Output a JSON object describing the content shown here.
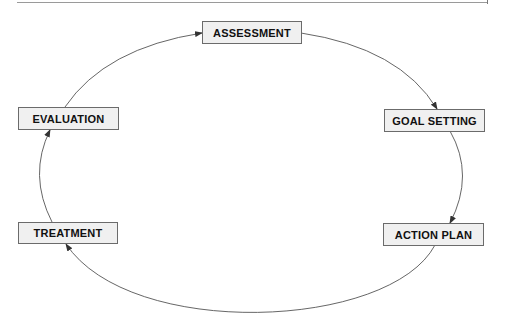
{
  "diagram": {
    "type": "cycle",
    "nodes": [
      {
        "id": "assessment",
        "label": "ASSESSMENT"
      },
      {
        "id": "goal_setting",
        "label": "GOAL SETTING"
      },
      {
        "id": "action_plan",
        "label": "ACTION PLAN"
      },
      {
        "id": "treatment",
        "label": "TREATMENT"
      },
      {
        "id": "evaluation",
        "label": "EVALUATION"
      }
    ],
    "edges": [
      {
        "from": "ASSESSMENT",
        "to": "GOAL SETTING"
      },
      {
        "from": "GOAL SETTING",
        "to": "ACTION PLAN"
      },
      {
        "from": "ACTION PLAN",
        "to": "TREATMENT"
      },
      {
        "from": "TREATMENT",
        "to": "EVALUATION"
      },
      {
        "from": "EVALUATION",
        "to": "ASSESSMENT"
      }
    ],
    "colors": {
      "node_fill": "#f0f0f0",
      "node_border": "#6b6b6b",
      "edge": "#555555",
      "text": "#111111"
    }
  }
}
